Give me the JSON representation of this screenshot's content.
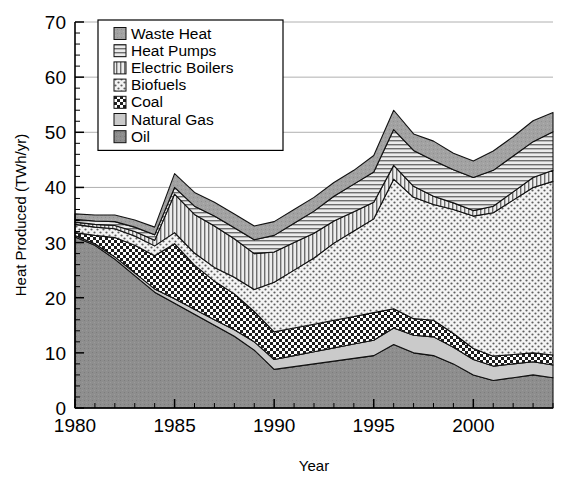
{
  "chart_data": {
    "type": "area",
    "title": "",
    "xlabel": "Year",
    "ylabel": "Heat Produced (TWh/yr)",
    "xlim": [
      1980,
      2004
    ],
    "ylim": [
      0,
      70
    ],
    "yticks": [
      0,
      10,
      20,
      30,
      40,
      50,
      60,
      70
    ],
    "xticks": [
      1980,
      1985,
      1990,
      1995,
      2000
    ],
    "xtick_minor_step": 1,
    "grid": true,
    "stacked": true,
    "legend_position": "top-left",
    "legend_order": [
      "Waste Heat",
      "Heat Pumps",
      "Electric Boilers",
      "Biofuels",
      "Coal",
      "Natural Gas",
      "Oil"
    ],
    "stack_order_bottom_to_top": [
      "Oil",
      "Natural Gas",
      "Coal",
      "Biofuels",
      "Electric Boilers",
      "Heat Pumps",
      "Waste Heat"
    ],
    "x": [
      1980,
      1981,
      1982,
      1983,
      1984,
      1985,
      1986,
      1987,
      1988,
      1989,
      1990,
      1991,
      1992,
      1993,
      1994,
      1995,
      1996,
      1997,
      1998,
      1999,
      2000,
      2001,
      2002,
      2003,
      2004
    ],
    "series": [
      {
        "name": "Oil",
        "pattern": "solid-gray",
        "color": "#8e8e8e",
        "values": [
          31.0,
          29.5,
          27.0,
          24.0,
          21.0,
          19.0,
          17.0,
          15.0,
          13.0,
          10.5,
          7.0,
          7.5,
          8.0,
          8.5,
          9.0,
          9.5,
          11.5,
          10.0,
          9.5,
          8.0,
          6.0,
          5.0,
          5.5,
          6.0,
          5.5
        ]
      },
      {
        "name": "Natural Gas",
        "pattern": "light-gray",
        "color": "#c9c9c9",
        "values": [
          0.3,
          0.3,
          0.4,
          0.5,
          0.6,
          0.8,
          0.9,
          1.0,
          1.2,
          1.5,
          1.8,
          2.0,
          2.2,
          2.4,
          2.6,
          2.8,
          3.0,
          3.2,
          3.4,
          3.0,
          2.8,
          2.6,
          2.5,
          2.4,
          2.3
        ]
      },
      {
        "name": "Coal",
        "pattern": "checkerboard",
        "color": "#ffffff",
        "values": [
          0.5,
          1.5,
          3.5,
          5.0,
          6.0,
          10.0,
          8.0,
          7.0,
          6.5,
          5.5,
          5.0,
          5.0,
          5.0,
          5.0,
          5.0,
          5.0,
          3.5,
          3.0,
          3.0,
          2.5,
          2.0,
          1.8,
          1.7,
          1.6,
          1.8
        ]
      },
      {
        "name": "Biofuels",
        "pattern": "dotted",
        "color": "#f2f2f2",
        "values": [
          1.5,
          1.5,
          1.6,
          1.7,
          1.8,
          2.0,
          2.2,
          2.5,
          3.0,
          4.0,
          9.0,
          10.5,
          12.0,
          14.0,
          15.5,
          17.0,
          23.5,
          22.0,
          21.0,
          22.5,
          24.0,
          26.0,
          28.0,
          30.0,
          31.5
        ]
      },
      {
        "name": "Electric Boilers",
        "pattern": "vertical-lines",
        "color": "#e8e8e8",
        "values": [
          0.4,
          0.5,
          0.6,
          0.8,
          1.0,
          7.0,
          7.0,
          7.5,
          7.0,
          6.5,
          5.5,
          5.0,
          4.5,
          4.0,
          3.5,
          3.0,
          2.5,
          2.0,
          1.5,
          1.2,
          1.0,
          1.2,
          1.5,
          1.8,
          2.0
        ]
      },
      {
        "name": "Heat Pumps",
        "pattern": "horizontal-lines",
        "color": "#e0e0e0",
        "values": [
          0.5,
          0.6,
          0.7,
          0.8,
          1.0,
          1.2,
          1.5,
          1.8,
          2.0,
          2.5,
          3.0,
          3.5,
          4.0,
          4.5,
          5.0,
          5.5,
          6.5,
          6.5,
          6.5,
          6.0,
          6.0,
          6.5,
          6.5,
          6.5,
          7.0
        ]
      },
      {
        "name": "Waste Heat",
        "pattern": "medium-gray",
        "color": "#a0a0a0",
        "values": [
          1.0,
          1.1,
          1.2,
          1.3,
          1.4,
          2.5,
          2.5,
          2.5,
          2.5,
          2.5,
          2.5,
          2.5,
          2.5,
          2.5,
          2.5,
          3.0,
          3.5,
          3.0,
          3.5,
          3.0,
          3.0,
          3.5,
          3.5,
          3.8,
          3.5
        ]
      }
    ],
    "totals": [
      35.2,
      35.0,
      35.0,
      34.1,
      32.8,
      42.5,
      39.1,
      37.3,
      35.2,
      33.0,
      33.8,
      36.0,
      38.2,
      40.9,
      43.1,
      45.8,
      54.0,
      49.7,
      48.4,
      46.2,
      44.8,
      46.6,
      49.2,
      52.1,
      53.6
    ]
  },
  "axis": {
    "y_title": "Heat Produced (TWh/yr)",
    "x_title": "Year",
    "y_labels": [
      "70",
      "60",
      "50",
      "40",
      "30",
      "20",
      "10",
      "0"
    ],
    "x_labels": [
      "1980",
      "1985",
      "1990",
      "1995",
      "2000"
    ]
  },
  "legend": {
    "items": [
      {
        "label": "Waste Heat",
        "swatch": "waste-heat-swatch"
      },
      {
        "label": "Heat Pumps",
        "swatch": "heat-pumps-swatch"
      },
      {
        "label": "Electric Boilers",
        "swatch": "electric-boilers-swatch"
      },
      {
        "label": "Biofuels",
        "swatch": "biofuels-swatch"
      },
      {
        "label": "Coal",
        "swatch": "coal-swatch"
      },
      {
        "label": "Natural Gas",
        "swatch": "natural-gas-swatch"
      },
      {
        "label": "Oil",
        "swatch": "oil-swatch"
      }
    ]
  },
  "colors": {
    "oil": "#8e8e8e",
    "natural_gas": "#c9c9c9",
    "coal": "#ffffff",
    "biofuels": "#f2f2f2",
    "electric_boilers": "#e8e8e8",
    "heat_pumps": "#e0e0e0",
    "waste_heat": "#a0a0a0",
    "axis": "#000000",
    "grid": "#b0b0b0"
  }
}
